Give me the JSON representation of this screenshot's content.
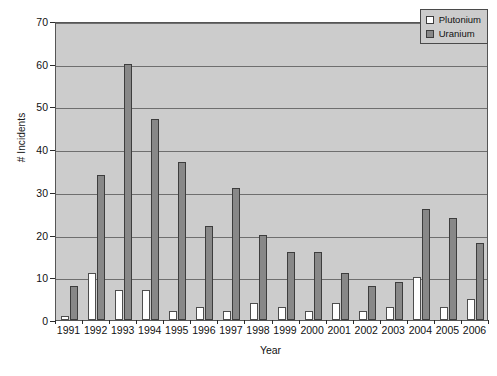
{
  "chart_data": {
    "type": "bar",
    "title": "",
    "xlabel": "Year",
    "ylabel": "# Incidents",
    "categories": [
      "1991",
      "1992",
      "1993",
      "1994",
      "1995",
      "1996",
      "1997",
      "1998",
      "1999",
      "2000",
      "2001",
      "2002",
      "2003",
      "2004",
      "2005",
      "2006"
    ],
    "series": [
      {
        "name": "Plutonium",
        "color": "#ffffff",
        "values": [
          1,
          11,
          7,
          7,
          2,
          3,
          2,
          4,
          3,
          2,
          4,
          2,
          3,
          10,
          3,
          5
        ]
      },
      {
        "name": "Uranium",
        "color": "#888888",
        "values": [
          8,
          34,
          60,
          47,
          37,
          22,
          31,
          20,
          16,
          16,
          11,
          8,
          9,
          26,
          24,
          18
        ]
      }
    ],
    "ylim": [
      0,
      70
    ],
    "yticks": [
      0,
      10,
      20,
      30,
      40,
      50,
      60,
      70
    ],
    "grid": true,
    "legend_position": "top-right",
    "plot_background": "#cccccc"
  },
  "legend": {
    "items": [
      {
        "label": "Plutonium"
      },
      {
        "label": "Uranium"
      }
    ]
  },
  "axes": {
    "y_title": "# Incidents",
    "x_title": "Year"
  }
}
